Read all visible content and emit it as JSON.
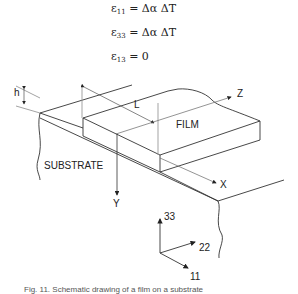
{
  "equations": [
    {
      "lhs_symbol": "ε",
      "lhs_sub": "11",
      "rhs": "= Δα ΔT"
    },
    {
      "lhs_symbol": "ε",
      "lhs_sub": "33",
      "rhs": "= Δα ΔT"
    },
    {
      "lhs_symbol": "ε",
      "lhs_sub": "13",
      "rhs": "= 0"
    }
  ],
  "diagram": {
    "labels": {
      "h": "h",
      "L": "L",
      "z": "Z",
      "film": "FILM",
      "substrate": "SUBSTRATE",
      "x": "X",
      "y": "Y"
    },
    "axes_triad": {
      "a33": "33",
      "a22": "22",
      "a11": "11"
    }
  },
  "caption": "Fig. 11.  Schematic drawing of a film on a substrate"
}
